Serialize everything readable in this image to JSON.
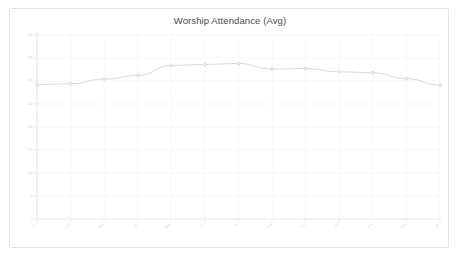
{
  "card": {
    "background_color": "#ffffff",
    "border_color": "#e3e3e3"
  },
  "chart_data": {
    "type": "line",
    "title": "Worship Attendance (Avg)",
    "xlabel": "",
    "ylabel": "",
    "ylim": [
      0,
      400
    ],
    "yticks": [
      0,
      50,
      100,
      150,
      200,
      250,
      300,
      350,
      400
    ],
    "ytick_labels": [
      "0",
      "50",
      "100",
      "150",
      "200",
      "250",
      "300",
      "350",
      "400"
    ],
    "grid": true,
    "legend": false,
    "line_color": "#d2d2d2",
    "marker_color": "#c8c8c8",
    "categories": [
      "Jan",
      "Feb",
      "Mar",
      "Apr",
      "May",
      "Jun",
      "Jul",
      "Aug",
      "Sep",
      "Oct",
      "Nov",
      "Dec",
      "Jan"
    ],
    "values": [
      292,
      294,
      304,
      312,
      334,
      336,
      338,
      326,
      327,
      320,
      318,
      305,
      291
    ],
    "series": [
      {
        "name": "Worship Attendance (Avg)",
        "values": [
          292,
          294,
          304,
          312,
          334,
          336,
          338,
          326,
          327,
          320,
          318,
          305,
          291
        ]
      }
    ]
  }
}
